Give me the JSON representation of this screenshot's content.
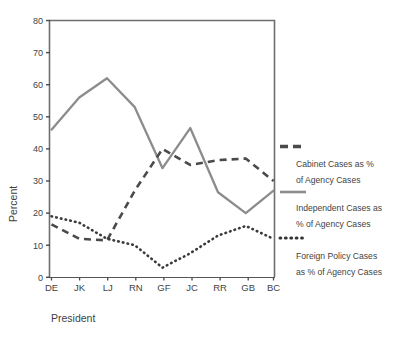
{
  "chart_data": {
    "type": "line",
    "title": "",
    "xlabel": "President",
    "ylabel": "Percent",
    "categories": [
      "DE",
      "JK",
      "LJ",
      "RN",
      "GF",
      "JC",
      "RR",
      "GB",
      "BC"
    ],
    "ylim": [
      0,
      80
    ],
    "ytick_step": 10,
    "yticks": [
      "0",
      "10",
      "20",
      "30",
      "40",
      "50",
      "60",
      "70",
      "80"
    ],
    "grid": false,
    "legend_position": "right",
    "series": [
      {
        "name": "Cabinet Cases as % of Agency Cases",
        "style": "dashed",
        "color": "#4a4a4a",
        "values": [
          16.5,
          12,
          11.5,
          27,
          40,
          35,
          36.5,
          37,
          30
        ]
      },
      {
        "name": "Independent Cases as % of Agency Cases",
        "style": "solid",
        "color": "#8c8c8c",
        "values": [
          46,
          56,
          62,
          53,
          34,
          46.5,
          26.5,
          20,
          27
        ]
      },
      {
        "name": "Foreign Policy Cases as % of Agency Cases",
        "style": "dotted",
        "color": "#3a3a3a",
        "values": [
          19,
          17,
          12,
          10,
          3,
          7.5,
          13,
          16,
          12
        ]
      }
    ]
  },
  "axes": {
    "y_axis_label": "Percent",
    "x_axis_label": "President"
  },
  "legend": {
    "entries": [
      {
        "swatch": "dashed-line-swatch",
        "line1": "Cabinet Cases as %",
        "line2": "of Agency Cases"
      },
      {
        "swatch": "solid-line-swatch",
        "line1": "Independent Cases as",
        "line2": "% of Agency Cases"
      },
      {
        "swatch": "dotted-line-swatch",
        "line1": "Foreign Policy Cases",
        "line2": "as % of Agency Cases"
      }
    ]
  },
  "colors": {
    "cabinet": "#4a4a4a",
    "independent": "#8c8c8c",
    "foreign_policy": "#3a3a3a",
    "axis": "#6e6e6e",
    "text": "#3f3f3f"
  }
}
